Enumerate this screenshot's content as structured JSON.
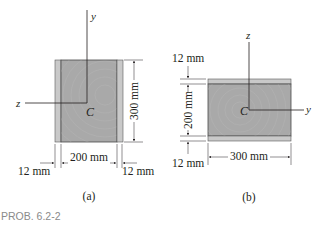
{
  "figure": {
    "problem_label": "PROB. 6.2-2",
    "colors": {
      "wood": "#a9a9a9",
      "plank": "#c9c9c9",
      "line": "#231f20",
      "problem_label": "#8a8a8a"
    }
  },
  "fig_a": {
    "caption": "(a)",
    "axis_vertical": "y",
    "axis_horizontal": "z",
    "centroid": "C",
    "dim_height": "300 mm",
    "dim_width": "200 mm",
    "dim_left_plank": "12 mm",
    "dim_right_plank": "12 mm"
  },
  "fig_b": {
    "caption": "(b)",
    "axis_vertical": "z",
    "axis_horizontal": "y",
    "centroid": "C",
    "dim_top_plank": "12 mm",
    "dim_height": "200 mm",
    "dim_bottom_plank": "12 mm",
    "dim_width": "300 mm"
  }
}
